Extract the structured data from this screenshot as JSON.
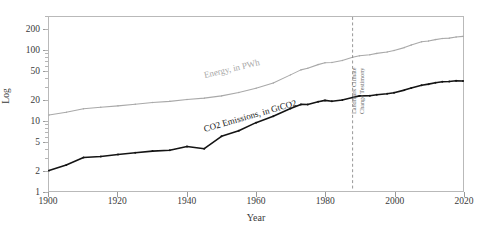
{
  "chart_data": {
    "type": "line",
    "title": "",
    "xlabel": "Year",
    "ylabel": "Log",
    "yscale": "log",
    "ylim": [
      1,
      300
    ],
    "xlim": [
      1900,
      2020
    ],
    "grid": false,
    "legend_position": "inline-labels",
    "ytick_labels": [
      "1",
      "2",
      "5",
      "10",
      "20",
      "50",
      "100",
      "200"
    ],
    "ytick_values": [
      1,
      2,
      5,
      10,
      20,
      50,
      100,
      200
    ],
    "xtick_labels": [
      "1900",
      "1920",
      "1940",
      "1960",
      "1980",
      "2000",
      "2020"
    ],
    "xtick_values": [
      1900,
      1920,
      1940,
      1960,
      1980,
      2000,
      2020
    ],
    "annotations": [
      {
        "name": "landmark-climate-change-testimony",
        "x": 1988,
        "line1": "Landmark Climate",
        "line2": "Change Testimony",
        "style": "dashed-vertical",
        "color": "#8a8a8a"
      }
    ],
    "series": [
      {
        "name": "Energy, in PWh",
        "label": "Energy, in PWh",
        "color": "#a9a9a9",
        "x": [
          1900,
          1905,
          1910,
          1915,
          1920,
          1925,
          1930,
          1935,
          1940,
          1945,
          1950,
          1955,
          1960,
          1965,
          1970,
          1973,
          1975,
          1978,
          1980,
          1982,
          1985,
          1988,
          1990,
          1993,
          1995,
          1998,
          2000,
          2003,
          2005,
          2008,
          2010,
          2012,
          2014,
          2016,
          2018,
          2020
        ],
        "values": [
          12.1,
          13.2,
          14.8,
          15.6,
          16.3,
          17.2,
          18.2,
          18.9,
          20.1,
          21.0,
          22.6,
          25.2,
          29.0,
          34.5,
          45.0,
          53.0,
          56.0,
          63.0,
          67.0,
          67.5,
          72.0,
          80.0,
          84.0,
          87.0,
          91.0,
          95.0,
          100.0,
          110.0,
          120.0,
          133.0,
          137.0,
          143.0,
          148.0,
          150.0,
          156.0,
          159.0
        ]
      },
      {
        "name": "CO2 Emissions, in GtCO2",
        "label": "CO2 Emissions, in GtCO2",
        "color": "#141414",
        "x": [
          1900,
          1905,
          1910,
          1915,
          1920,
          1925,
          1930,
          1935,
          1940,
          1945,
          1950,
          1955,
          1960,
          1965,
          1970,
          1973,
          1975,
          1978,
          1980,
          1982,
          1985,
          1988,
          1990,
          1993,
          1995,
          1998,
          2000,
          2003,
          2005,
          2008,
          2010,
          2012,
          2014,
          2016,
          2018,
          2020
        ],
        "values": [
          1.95,
          2.35,
          3.0,
          3.1,
          3.3,
          3.5,
          3.7,
          3.8,
          4.3,
          4.0,
          6.0,
          7.2,
          9.4,
          11.6,
          14.9,
          17.1,
          17.0,
          18.6,
          19.5,
          19.0,
          19.8,
          21.5,
          22.6,
          22.7,
          23.4,
          24.2,
          25.0,
          27.3,
          29.3,
          32.0,
          33.2,
          34.8,
          36.0,
          36.2,
          37.1,
          36.8
        ]
      }
    ]
  },
  "axis": {
    "y_title": "Log",
    "x_title": "Year"
  }
}
